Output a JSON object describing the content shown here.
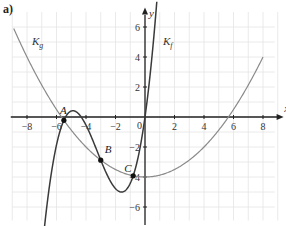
{
  "panel_label": "a)",
  "chart_data": {
    "type": "line",
    "title": "",
    "xlabel": "x",
    "ylabel": "y",
    "xlim": [
      -9.5,
      9.5
    ],
    "ylim": [
      -7,
      7
    ],
    "grid": true,
    "x_ticks": [
      -8,
      -6,
      -4,
      -2,
      0,
      2,
      4,
      6,
      8
    ],
    "x_tick_labels": [
      "−8",
      "−6",
      "−4",
      "−2",
      "0",
      "2",
      "4",
      "6",
      "8"
    ],
    "y_ticks": [
      -6,
      -4,
      -2,
      2,
      4,
      6
    ],
    "y_tick_labels": [
      "−6",
      "−4",
      "−2",
      "2",
      "4",
      "6"
    ],
    "series": [
      {
        "name": "K_f",
        "label": "K",
        "subscript": "f",
        "color": "#3a3a3a",
        "description": "cubic through A, B, C and origin",
        "x": [
          -6.9,
          -6.5,
          -6,
          -5.5,
          -5,
          -4.5,
          -4,
          -3.5,
          -3,
          -2.5,
          -2,
          -1.5,
          -1,
          -0.5,
          0,
          0.5,
          0.8
        ],
        "values": [
          -8.1,
          -4.8,
          -2.1,
          -0.22,
          0.6,
          0.55,
          -0.2,
          -1.4,
          -2.88,
          -4.0,
          -4.75,
          -4.9,
          -4.2,
          -2.6,
          0.0,
          4.2,
          7.0
        ]
      },
      {
        "name": "K_g",
        "label": "K",
        "subscript": "g",
        "color": "#8a8a8a",
        "description": "parabola g(x) ≈ 0.125x² − 4",
        "x": [
          -8.9,
          -8,
          -6,
          -4,
          -2,
          0,
          2,
          4,
          6,
          8
        ],
        "values": [
          5.9,
          4.0,
          0.5,
          -2.0,
          -3.5,
          -4.0,
          -3.5,
          -2.0,
          0.5,
          4.0
        ]
      }
    ],
    "points": [
      {
        "label": "A",
        "x": -5.5,
        "y": -0.22
      },
      {
        "label": "B",
        "x": -3.0,
        "y": -2.88
      },
      {
        "label": "C",
        "x": -0.8,
        "y": -3.92
      }
    ]
  }
}
